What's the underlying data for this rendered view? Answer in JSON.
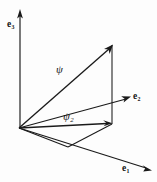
{
  "figure": {
    "kind": "vector-decomposition-diagram",
    "background_color": "#fdfdfd",
    "ink_color": "#1a1a1a",
    "width": 157,
    "height": 182
  },
  "axes": [
    {
      "id": "e3",
      "label": "e",
      "subscript": "3",
      "name": "e3-axis",
      "direction": "vertical-up"
    },
    {
      "id": "e2",
      "label": "e",
      "subscript": "2",
      "name": "e2-axis",
      "direction": "upper-right"
    },
    {
      "id": "e1",
      "label": "e",
      "subscript": "1",
      "name": "e1-axis",
      "direction": "lower-right"
    }
  ],
  "vectors": [
    {
      "id": "psi",
      "label": "ψ",
      "subscript": "",
      "name": "psi-vector"
    },
    {
      "id": "psi2",
      "label": "ψ",
      "subscript": "2",
      "name": "psi2-component-vector"
    }
  ],
  "geometry": {
    "origin": {
      "x": 19,
      "y": 128
    },
    "e3_tip": {
      "x": 20,
      "y": 10
    },
    "e2_tip": {
      "x": 131,
      "y": 96
    },
    "e1_tip": {
      "x": 151,
      "y": 170
    },
    "psi_tip": {
      "x": 112,
      "y": 45
    },
    "psi2_tip": {
      "x": 112,
      "y": 123
    },
    "base_corner": {
      "x": 68,
      "y": 147
    }
  }
}
